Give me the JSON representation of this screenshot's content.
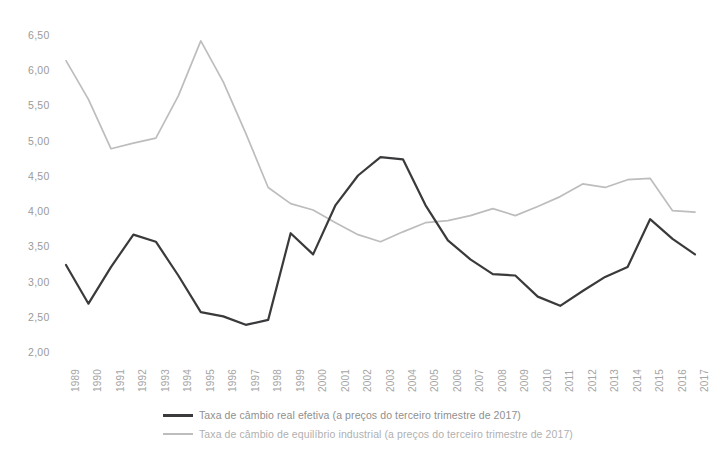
{
  "chart_data": {
    "type": "line",
    "title": "",
    "xlabel": "",
    "ylabel": "",
    "x": [
      1989,
      1990,
      1991,
      1992,
      1993,
      1994,
      1995,
      1996,
      1997,
      1998,
      1999,
      2000,
      2001,
      2002,
      2003,
      2004,
      2005,
      2006,
      2007,
      2008,
      2009,
      2010,
      2011,
      2012,
      2013,
      2014,
      2015,
      2016,
      2017
    ],
    "xtick_labels": [
      "1989",
      "1990",
      "1991",
      "1992",
      "1993",
      "1994",
      "1995",
      "1996",
      "1997",
      "1998",
      "1999",
      "2000",
      "2001",
      "2002",
      "2003",
      "2004",
      "2005",
      "2006",
      "2007",
      "2008",
      "2009",
      "2010",
      "2011",
      "2012",
      "2013",
      "2014",
      "2015",
      "2016",
      "2017"
    ],
    "ytick_labels": [
      "6,50",
      "6,00",
      "5,50",
      "5,00",
      "4,50",
      "4,00",
      "3,50",
      "3,00",
      "2,50",
      "2,00"
    ],
    "ytick_values": [
      6.5,
      6.0,
      5.5,
      5.0,
      4.5,
      4.0,
      3.5,
      3.0,
      2.5,
      2.0
    ],
    "ylim": [
      2.0,
      6.5
    ],
    "xlim": [
      1989,
      2017
    ],
    "grid": false,
    "legend_position": "bottom",
    "series": [
      {
        "name": "Taxa de câmbio real efetiva (a preços do terceiro trimestre de 2017)",
        "color": "#3a3a3c",
        "values": [
          3.25,
          2.7,
          3.22,
          3.68,
          3.58,
          3.1,
          2.58,
          2.52,
          2.4,
          2.47,
          3.7,
          3.4,
          4.1,
          4.52,
          4.78,
          4.75,
          4.1,
          3.6,
          3.33,
          3.12,
          3.1,
          2.8,
          2.67,
          2.88,
          3.08,
          3.22,
          3.9,
          3.62,
          3.4
        ]
      },
      {
        "name": "Taxa de câmbio de equilíbrio industrial (a preços do terceiro trimestre de 2017)",
        "color": "#bdbdbd",
        "values": [
          6.15,
          5.6,
          4.9,
          4.98,
          5.05,
          5.65,
          6.43,
          5.85,
          5.12,
          4.35,
          4.12,
          4.03,
          3.85,
          3.68,
          3.58,
          3.72,
          3.85,
          3.88,
          3.95,
          4.05,
          3.95,
          4.08,
          4.22,
          4.4,
          4.35,
          4.46,
          4.48,
          4.02,
          4.0
        ]
      }
    ]
  },
  "legend": {
    "items": [
      {
        "label": "Taxa de câmbio real efetiva (a preços do terceiro trimestre de 2017)",
        "swatch": "dark"
      },
      {
        "label": "Taxa de câmbio de equilíbrio industrial (a preços do terceiro trimestre de 2017)",
        "swatch": "light"
      }
    ]
  }
}
